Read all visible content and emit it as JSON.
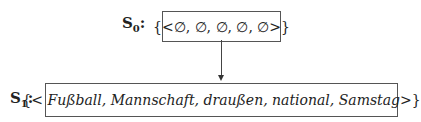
{
  "states": [
    {
      "label_letter": "S",
      "label_sub": "0",
      "label_suffix": ":",
      "open": "{<",
      "items_text": "∅, ∅, ∅, ∅, ∅",
      "close": ">}"
    },
    {
      "label_letter": "S",
      "label_sub": "1",
      "label_suffix": ":",
      "open": "{<",
      "items_text": "Fußball, Mannschaft, draußen, national, Samstag",
      "close": ">}"
    }
  ],
  "edges": [
    {
      "from": "S0",
      "to": "S1",
      "type": "arrow-down"
    }
  ]
}
